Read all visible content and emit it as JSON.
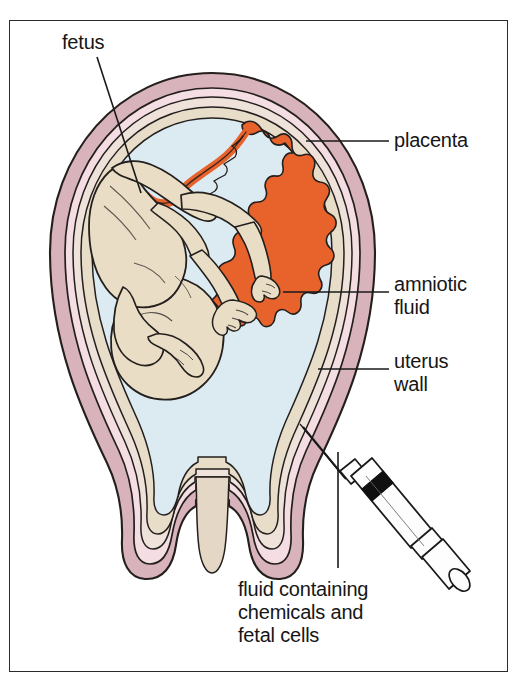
{
  "figure": {
    "type": "medical-illustration"
  },
  "labels": {
    "fetus": "fetus",
    "placenta": "placenta",
    "amniotic_fluid": "amniotic\nfluid",
    "uterus_wall": "uterus\nwall",
    "fluid_sample": "fluid containing\nchemicals and\nfetal cells"
  },
  "colors": {
    "frame_border": "#2b2b2b",
    "background": "#ffffff",
    "uterus_wall": "#d9b3bb",
    "uterus_inner_layer": "#f3dde2",
    "myometrium_pale": "#efe0d6",
    "amnion": "#e8ddc9",
    "amniotic_fluid": "#dcebf2",
    "fetus_body": "#e9ddc6",
    "placenta": "#e8622c",
    "umbilical_cord": "#e8622c",
    "cervix": "#e4d7c6",
    "outline": "#231f1d",
    "syringe_barrel": "#fdfdfd",
    "syringe_plunger_band": "#101010",
    "leader_line": "#1a1a1a",
    "text": "#161616"
  },
  "parts": [
    {
      "name": "fetus",
      "label": "fetus"
    },
    {
      "name": "placenta",
      "label": "placenta"
    },
    {
      "name": "amniotic-fluid",
      "label": "amniotic fluid"
    },
    {
      "name": "uterus-wall",
      "label": "uterus wall"
    },
    {
      "name": "umbilical-cord",
      "label": "umbilical cord"
    },
    {
      "name": "cervix",
      "label": "cervix"
    },
    {
      "name": "syringe",
      "label": "syringe"
    },
    {
      "name": "needle",
      "label": "needle"
    }
  ]
}
